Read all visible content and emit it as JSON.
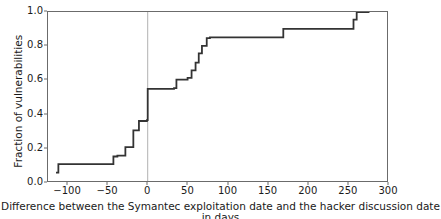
{
  "chart_data": {
    "type": "line",
    "subtype": "step-ecdf",
    "title": "",
    "xlabel": "Difference between the Symantec exploitation date and the hacker discussion date in days",
    "ylabel": "Fraction of vulnerabilities",
    "xlim": [
      -125,
      300
    ],
    "ylim": [
      0.0,
      1.0
    ],
    "xticks": [
      -100,
      -50,
      0,
      50,
      100,
      150,
      200,
      250,
      300
    ],
    "xticklabels": [
      "−100",
      "−50",
      "0",
      "50",
      "100",
      "150",
      "200",
      "250",
      "300"
    ],
    "yticks": [
      0.0,
      0.2,
      0.4,
      0.6,
      0.8,
      1.0
    ],
    "yticklabels": [
      "0.0",
      "0.2",
      "0.4",
      "0.6",
      "0.8",
      "1.0"
    ],
    "grid": false,
    "legend": null,
    "annotations": [
      {
        "name": "zero-reference-line",
        "type": "vline",
        "x": 0,
        "color": "#b0b0b0"
      }
    ],
    "series": [
      {
        "name": "Empirical CDF of exploitation-discussion date difference",
        "color": "#333333",
        "linewidth": 1.8,
        "x": [
          -115,
          -112,
          -112,
          -43,
          -43,
          -38,
          -38,
          -28,
          -28,
          -18,
          -18,
          -11,
          -11,
          -1,
          -1,
          0,
          0,
          33,
          33,
          36,
          36,
          50,
          50,
          55,
          55,
          60,
          60,
          64,
          64,
          68,
          68,
          74,
          74,
          78,
          78,
          170,
          170,
          258,
          258,
          262,
          262,
          278
        ],
        "y": [
          0.05,
          0.05,
          0.1,
          0.1,
          0.145,
          0.145,
          0.15,
          0.15,
          0.2,
          0.2,
          0.3,
          0.3,
          0.355,
          0.355,
          0.36,
          0.36,
          0.545,
          0.545,
          0.55,
          0.55,
          0.6,
          0.6,
          0.61,
          0.61,
          0.655,
          0.655,
          0.7,
          0.7,
          0.755,
          0.755,
          0.8,
          0.8,
          0.845,
          0.845,
          0.85,
          0.85,
          0.9,
          0.9,
          0.955,
          0.955,
          1.0,
          1.0
        ],
        "points": [
          {
            "x": -115,
            "y": 0.05
          },
          {
            "x": -112,
            "y": 0.1
          },
          {
            "x": -43,
            "y": 0.145
          },
          {
            "x": -38,
            "y": 0.15
          },
          {
            "x": -28,
            "y": 0.2
          },
          {
            "x": -18,
            "y": 0.3
          },
          {
            "x": -11,
            "y": 0.355
          },
          {
            "x": -1,
            "y": 0.36
          },
          {
            "x": 0,
            "y": 0.545
          },
          {
            "x": 33,
            "y": 0.55
          },
          {
            "x": 36,
            "y": 0.6
          },
          {
            "x": 50,
            "y": 0.61
          },
          {
            "x": 55,
            "y": 0.655
          },
          {
            "x": 60,
            "y": 0.7
          },
          {
            "x": 64,
            "y": 0.755
          },
          {
            "x": 68,
            "y": 0.8
          },
          {
            "x": 74,
            "y": 0.845
          },
          {
            "x": 78,
            "y": 0.85
          },
          {
            "x": 170,
            "y": 0.9
          },
          {
            "x": 258,
            "y": 0.955
          },
          {
            "x": 262,
            "y": 1.0
          },
          {
            "x": 278,
            "y": 1.0
          }
        ]
      }
    ]
  },
  "style": {
    "line_color": "#333333",
    "axis_color": "#6b6b6b",
    "text_color": "#1a1a1a",
    "gridline_color": "#b0b0b0",
    "background": "#ffffff"
  }
}
